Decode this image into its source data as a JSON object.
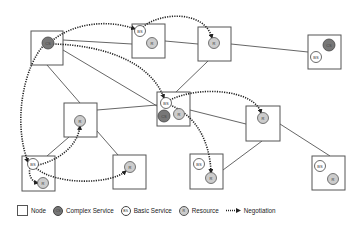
{
  "diagram": {
    "type": "service-negotiation-network",
    "nodes": [
      {
        "id": "A",
        "services": [
          {
            "kind": "cs",
            "label": "CS"
          }
        ]
      },
      {
        "id": "B",
        "services": [
          {
            "kind": "bs",
            "label": "BS"
          },
          {
            "kind": "r",
            "label": "R"
          }
        ]
      },
      {
        "id": "C",
        "services": [
          {
            "kind": "r",
            "label": "R"
          }
        ]
      },
      {
        "id": "D",
        "services": [
          {
            "kind": "cs",
            "label": "CS"
          },
          {
            "kind": "bs",
            "label": "BS"
          }
        ]
      },
      {
        "id": "E",
        "services": [
          {
            "kind": "bs",
            "label": "BS"
          },
          {
            "kind": "cs",
            "label": "CS"
          },
          {
            "kind": "r",
            "label": "R"
          }
        ]
      },
      {
        "id": "F",
        "services": [
          {
            "kind": "r",
            "label": "R"
          }
        ]
      },
      {
        "id": "G",
        "services": [
          {
            "kind": "r",
            "label": "R"
          }
        ]
      },
      {
        "id": "H",
        "services": [
          {
            "kind": "bs",
            "label": "BS"
          },
          {
            "kind": "r",
            "label": "R"
          }
        ]
      },
      {
        "id": "I",
        "services": [
          {
            "kind": "r",
            "label": "R"
          }
        ]
      },
      {
        "id": "J",
        "services": [
          {
            "kind": "bs",
            "label": "BS"
          },
          {
            "kind": "r",
            "label": "R"
          }
        ]
      },
      {
        "id": "K",
        "services": [
          {
            "kind": "bs",
            "label": "BS"
          },
          {
            "kind": "r",
            "label": "R"
          }
        ]
      }
    ],
    "links": [
      [
        "A",
        "B"
      ],
      [
        "A",
        "E"
      ],
      [
        "A",
        "F"
      ],
      [
        "B",
        "C"
      ],
      [
        "C",
        "D"
      ],
      [
        "C",
        "E"
      ],
      [
        "E",
        "G"
      ],
      [
        "E",
        "F"
      ],
      [
        "F",
        "H"
      ],
      [
        "F",
        "I"
      ],
      [
        "G",
        "J"
      ],
      [
        "G",
        "K"
      ]
    ],
    "negotiations": [
      {
        "from": "A.CS",
        "to": "B.BS"
      },
      {
        "from": "A.CS",
        "to": "E.BS"
      },
      {
        "from": "A.CS",
        "to": "H.BS"
      },
      {
        "from": "B.BS",
        "to": "C.R"
      },
      {
        "from": "E.BS",
        "to": "G.R"
      },
      {
        "from": "E.BS",
        "to": "J.R"
      },
      {
        "from": "H.BS",
        "to": "F.R"
      },
      {
        "from": "H.BS",
        "to": "H.R"
      },
      {
        "from": "H.BS",
        "to": "I.R"
      }
    ]
  },
  "legend": {
    "node": "Node",
    "complex_service_abbr": "CS",
    "complex_service": "Complex Service",
    "basic_service_abbr": "BS",
    "basic_service": "Basic Service",
    "resource_abbr": "R",
    "resource": "Resource",
    "negotiation": "Negotiation"
  },
  "colors": {
    "complex_service": "#777777",
    "basic_service": "#ffffff",
    "resource": "#cccccc",
    "negotiation": "#222222"
  }
}
